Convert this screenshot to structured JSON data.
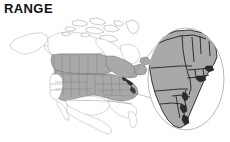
{
  "figure": {
    "title": "RANGE",
    "type": "species-range-map",
    "region": "North America",
    "background_color": "#ffffff"
  },
  "legend_colors": {
    "range_fill": "#a9a9a9",
    "outside_range_fill": "#ffffff",
    "coastline_stroke": "#8e8e8e",
    "inset_border_stroke": "#1b1b1b",
    "title_color": "#111111"
  },
  "main_map": {
    "name": "north-america-range-map",
    "shaded_meaning": "breeding / occurrence range",
    "unshaded_meaning": "outside range"
  },
  "inset": {
    "name": "northeast-united-states-inset",
    "shape": "ellipse",
    "region": "Northeastern United States",
    "magnified": true
  },
  "connector": {
    "name": "inset-leader-lines",
    "count": 2
  }
}
